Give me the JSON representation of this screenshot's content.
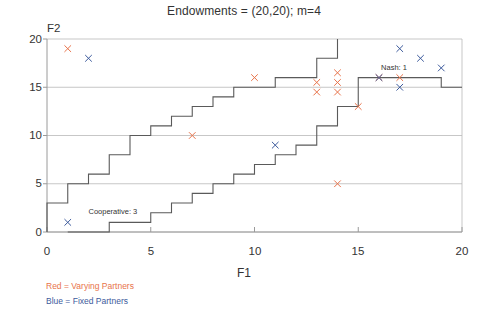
{
  "chart_data": {
    "type": "scatter",
    "title": "Endowments = (20,20); m=4",
    "xlabel": "F1",
    "ylabel": "F2",
    "xlim": [
      0,
      20
    ],
    "ylim": [
      0,
      20
    ],
    "xticks": [
      0,
      5,
      10,
      15,
      20
    ],
    "yticks": [
      0,
      5,
      10,
      15,
      20
    ],
    "xtick_labels": [
      "0",
      "5",
      "10",
      "15",
      "20"
    ],
    "ytick_labels": [
      "0",
      "5",
      "10",
      "15",
      "20"
    ],
    "grid": "horizontal",
    "legend_position": "below-axes-left",
    "series": [
      {
        "name": "Varying Partners",
        "color": "#e8734a",
        "marker": "x",
        "points": [
          [
            1,
            19
          ],
          [
            7,
            10
          ],
          [
            10,
            16
          ],
          [
            13,
            15.5
          ],
          [
            13,
            14.5
          ],
          [
            14,
            16.5
          ],
          [
            14,
            15.5
          ],
          [
            14,
            14.5
          ],
          [
            14,
            5
          ],
          [
            15,
            13
          ],
          [
            16,
            16
          ],
          [
            17,
            16
          ]
        ]
      },
      {
        "name": "Fixed Partners",
        "color": "#3c5a9c",
        "marker": "x",
        "points": [
          [
            1,
            1
          ],
          [
            2,
            18
          ],
          [
            11,
            9
          ],
          [
            16,
            16
          ],
          [
            17,
            15
          ],
          [
            17,
            19
          ],
          [
            18,
            18
          ],
          [
            19,
            17
          ]
        ]
      }
    ],
    "step_curves": [
      {
        "name": "upper-frontier-step",
        "color": "#5a5a5a",
        "points": [
          [
            0,
            0
          ],
          [
            0,
            3
          ],
          [
            1,
            3
          ],
          [
            1,
            5
          ],
          [
            2,
            5
          ],
          [
            2,
            6
          ],
          [
            3,
            6
          ],
          [
            3,
            8
          ],
          [
            4,
            8
          ],
          [
            4,
            10
          ],
          [
            5,
            10
          ],
          [
            5,
            11
          ],
          [
            6,
            11
          ],
          [
            6,
            12
          ],
          [
            7,
            12
          ],
          [
            7,
            13
          ],
          [
            8,
            13
          ],
          [
            8,
            14
          ],
          [
            9,
            14
          ],
          [
            9,
            15
          ],
          [
            11,
            15
          ],
          [
            11,
            16
          ],
          [
            13,
            16
          ],
          [
            13,
            18
          ],
          [
            14,
            18
          ],
          [
            14,
            20
          ]
        ]
      },
      {
        "name": "lower-frontier-step",
        "color": "#5a5a5a",
        "points": [
          [
            1,
            0
          ],
          [
            3,
            0
          ],
          [
            3,
            1
          ],
          [
            5,
            1
          ],
          [
            5,
            2
          ],
          [
            6,
            2
          ],
          [
            6,
            3
          ],
          [
            7,
            3
          ],
          [
            7,
            4
          ],
          [
            8,
            4
          ],
          [
            8,
            5
          ],
          [
            9,
            5
          ],
          [
            9,
            6
          ],
          [
            10,
            6
          ],
          [
            10,
            7
          ],
          [
            11,
            7
          ],
          [
            11,
            8
          ],
          [
            12,
            8
          ],
          [
            12,
            9
          ],
          [
            13,
            9
          ],
          [
            13,
            11
          ],
          [
            14,
            11
          ],
          [
            14,
            13
          ],
          [
            15,
            13
          ],
          [
            15,
            16
          ],
          [
            19,
            16
          ],
          [
            19,
            15
          ],
          [
            20,
            15
          ]
        ]
      }
    ],
    "annotations": [
      {
        "name": "nash-label",
        "text": "Nash: 1",
        "x": 16.1,
        "y": 16.95
      },
      {
        "name": "cooperative-label",
        "text": "Cooperative: 3",
        "x": 2.0,
        "y": 2.05
      }
    ],
    "legend_entries": [
      {
        "label": "Red = Varying Partners",
        "color": "#e8734a"
      },
      {
        "label": "Blue = Fixed Partners",
        "color": "#3c5a9c"
      }
    ]
  }
}
